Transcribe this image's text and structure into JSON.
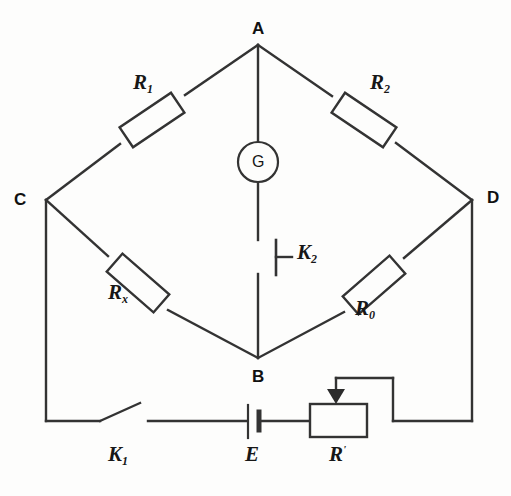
{
  "diagram": {
    "background_color": "#fdfdfc",
    "line_color": "#333333",
    "nodes": [
      {
        "id": "A",
        "label": "A",
        "x": 258,
        "y": 45
      },
      {
        "id": "B",
        "label": "B",
        "x": 258,
        "y": 358
      },
      {
        "id": "C",
        "label": "C",
        "x": 46,
        "y": 200
      },
      {
        "id": "D",
        "label": "D",
        "x": 472,
        "y": 200
      }
    ],
    "components": [
      {
        "id": "R1",
        "label": "R",
        "subscript": "1",
        "type": "resistor",
        "branch": "C-A",
        "label_x": 143,
        "label_y": 82
      },
      {
        "id": "R2",
        "label": "R",
        "subscript": "2",
        "type": "resistor",
        "branch": "A-D",
        "label_x": 378,
        "label_y": 82
      },
      {
        "id": "Rx",
        "label": "R",
        "subscript": "x",
        "type": "resistor",
        "branch": "C-B",
        "label_x": 118,
        "label_y": 292
      },
      {
        "id": "R0",
        "label": "R",
        "subscript": "0",
        "type": "resistor",
        "branch": "B-D",
        "label_x": 362,
        "label_y": 308
      },
      {
        "id": "G",
        "label": "G",
        "subscript": "",
        "type": "galvanometer",
        "branch": "A-B",
        "label_x": 258,
        "label_y": 162
      },
      {
        "id": "K2",
        "label": "K",
        "subscript": "2",
        "type": "switch",
        "branch": "A-B",
        "label_x": 298,
        "label_y": 250
      },
      {
        "id": "K1",
        "label": "K",
        "subscript": "1",
        "type": "switch",
        "branch": "C-E",
        "label_x": 110,
        "label_y": 450
      },
      {
        "id": "E",
        "label": "E",
        "subscript": "",
        "type": "battery",
        "branch": "K1-R",
        "label_x": 246,
        "label_y": 450
      },
      {
        "id": "R",
        "label": "R",
        "superscript": "'",
        "type": "rheostat",
        "branch": "E-D",
        "label_x": 330,
        "label_y": 450
      }
    ],
    "caption": ""
  }
}
